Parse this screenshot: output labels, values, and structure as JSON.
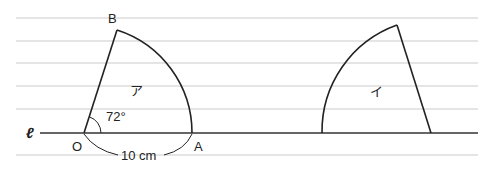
{
  "diagram": {
    "line_label": "ℓ",
    "points": {
      "O": "O",
      "A": "A",
      "B": "B"
    },
    "angle_label": "72°",
    "radius_label": "10 cm",
    "sector_left_label": "ア",
    "sector_right_label": "イ",
    "colors": {
      "stroke": "#222222",
      "ruled_line": "#dddddd"
    }
  }
}
